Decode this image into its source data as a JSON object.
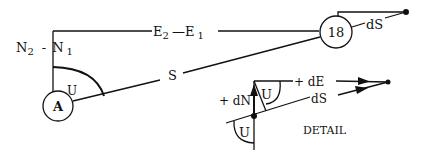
{
  "diagram": {
    "type": "survey-traverse-geometry",
    "nodes": {
      "station_a": {
        "label": "A"
      },
      "station_18": {
        "label": "18"
      }
    },
    "labels": {
      "easting_diff": {
        "main1": "E",
        "sub1": "2",
        "sep": "—",
        "main2": "E",
        "sub2": "1"
      },
      "northing_diff": {
        "main1": "N",
        "sub1": "2",
        "sep": "-",
        "main2": "N",
        "sub2": "1"
      },
      "distance": "S",
      "angle_main": "U",
      "ds_main": "dS"
    },
    "detail": {
      "title": "DETAIL",
      "plus_de": "+ dE",
      "plus_dn": "+ dN",
      "ds": "dS",
      "angle_upper": "U",
      "angle_lower": "U"
    },
    "colors": {
      "ink": "#111111",
      "background": "#ffffff"
    }
  }
}
